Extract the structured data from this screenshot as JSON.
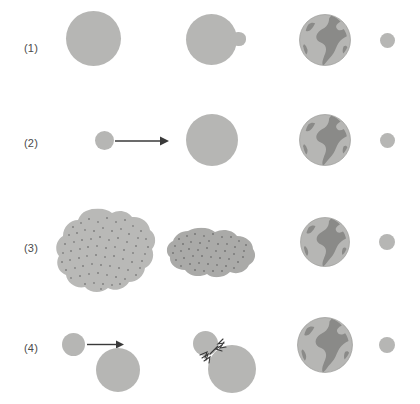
{
  "figure": {
    "background_color": "#ffffff",
    "body_color": "#b6b6b4",
    "continent_color": "#8a8a88",
    "label_color": "#4a4a4a",
    "stroke_color": "#3a3a3a",
    "dot_color": "#555555",
    "width": 420,
    "height": 404
  },
  "rows": [
    {
      "label": "(1)",
      "name": "fission-theory",
      "stages": [
        {
          "name": "molten-proto-earth",
          "caption": ""
        },
        {
          "name": "proto-earth-with-bulge",
          "caption": ""
        },
        {
          "name": "earth-globe",
          "caption": ""
        },
        {
          "name": "moon",
          "caption": ""
        }
      ]
    },
    {
      "label": "(2)",
      "name": "capture-theory",
      "stages": [
        {
          "name": "incoming-body-with-arrow",
          "caption": ""
        },
        {
          "name": "proto-earth",
          "caption": ""
        },
        {
          "name": "earth-globe",
          "caption": ""
        },
        {
          "name": "moon",
          "caption": ""
        }
      ]
    },
    {
      "label": "(3)",
      "name": "co-accretion-theory",
      "stages": [
        {
          "name": "large-dust-cloud",
          "caption": ""
        },
        {
          "name": "condensing-dust-cloud",
          "caption": ""
        },
        {
          "name": "earth-globe",
          "caption": ""
        },
        {
          "name": "moon",
          "caption": ""
        }
      ]
    },
    {
      "label": "(4)",
      "name": "giant-impact-theory",
      "stages": [
        {
          "name": "impactor-approaching-proto-earth",
          "caption": ""
        },
        {
          "name": "impactor-colliding-with-proto-earth",
          "caption": ""
        },
        {
          "name": "earth-globe",
          "caption": ""
        },
        {
          "name": "moon",
          "caption": ""
        }
      ]
    }
  ]
}
